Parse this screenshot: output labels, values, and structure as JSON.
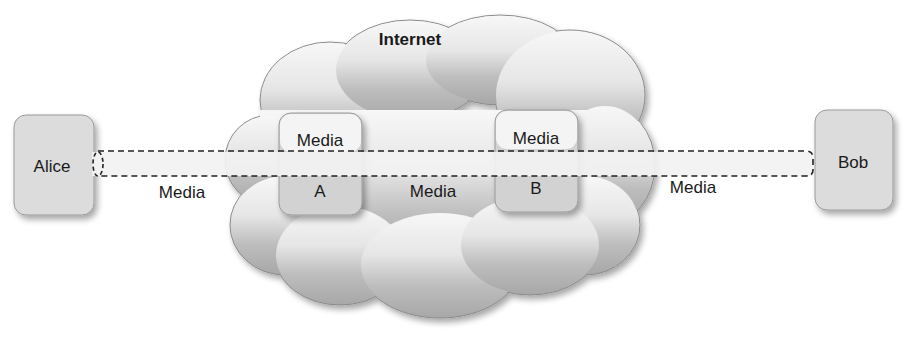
{
  "diagram": {
    "cloud": {
      "label": "Internet"
    },
    "endpoints": [
      {
        "id": "alice",
        "label": "Alice"
      },
      {
        "id": "bob",
        "label": "Bob"
      }
    ],
    "relays": [
      {
        "id": "relay-a",
        "top_label": "Media",
        "bottom_label": "A"
      },
      {
        "id": "relay-b",
        "top_label": "Media",
        "bottom_label": "B"
      }
    ],
    "links": [
      {
        "from": "alice",
        "to": "relay-a",
        "label": "Media"
      },
      {
        "from": "relay-a",
        "to": "relay-b",
        "label": "Media"
      },
      {
        "from": "relay-b",
        "to": "bob",
        "label": "Media"
      }
    ],
    "tunnel": {
      "style": "dashed",
      "from": "alice",
      "to": "bob"
    }
  }
}
